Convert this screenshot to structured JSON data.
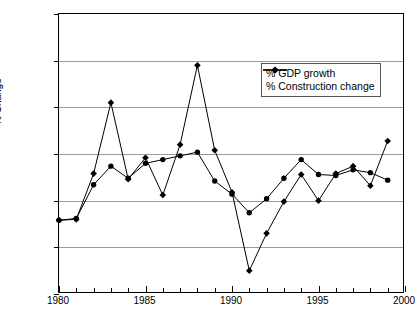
{
  "chart_data": {
    "type": "line",
    "title": "",
    "xlabel": "",
    "ylabel": "% Change",
    "xlim": [
      1980,
      2000
    ],
    "ylim": [
      -10,
      20
    ],
    "grid": true,
    "legend_position": "top-right",
    "x": [
      1980,
      1981,
      1982,
      1983,
      1984,
      1985,
      1986,
      1987,
      1988,
      1989,
      1990,
      1991,
      1992,
      1993,
      1994,
      1995,
      1996,
      1997,
      1998,
      1999
    ],
    "xticks": [
      1980,
      1985,
      1990,
      1995,
      2000
    ],
    "xtick_labels": [
      "1980",
      "1985",
      "1990",
      "1995",
      "2000"
    ],
    "yticks": [
      -10,
      -5,
      0,
      5,
      10,
      15,
      20
    ],
    "ytick_labels": [
      "-10",
      "-5",
      "0",
      "5",
      "10",
      "15",
      "20"
    ],
    "series": [
      {
        "name": "% GDP growth",
        "marker": "circle",
        "color": "#000000",
        "values": [
          -2.1,
          -1.9,
          1.7,
          3.7,
          2.4,
          4.0,
          4.4,
          4.8,
          5.2,
          2.1,
          0.7,
          -1.3,
          0.2,
          2.4,
          4.4,
          2.8,
          2.7,
          3.3,
          3.0,
          2.2
        ]
      },
      {
        "name": "% Construction change",
        "marker": "diamond",
        "color": "#000000",
        "values": [
          -2.1,
          -2.0,
          2.9,
          10.5,
          2.3,
          4.6,
          0.6,
          6.0,
          14.5,
          5.4,
          0.9,
          -7.5,
          -3.5,
          -0.1,
          2.8,
          0.0,
          2.9,
          3.7,
          1.6,
          6.4
        ]
      }
    ]
  },
  "legend": {
    "entries": [
      {
        "label": "% GDP growth"
      },
      {
        "label": "% Construction change"
      }
    ]
  },
  "axes": {
    "y_title": "% Change"
  }
}
